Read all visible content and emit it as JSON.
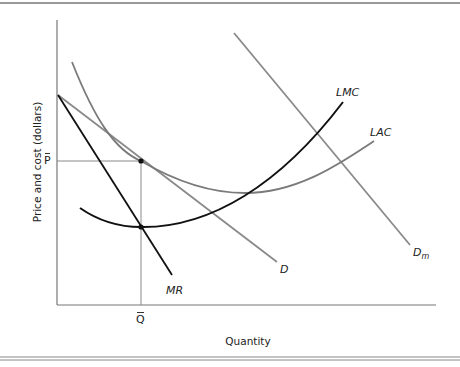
{
  "figure": {
    "type": "economics-diagram",
    "y_axis_label": "Price and cost (dollars)",
    "x_axis_label": "Quantity",
    "y_tick_label": "P",
    "x_tick_label": "Q",
    "curves": {
      "lmc": {
        "label": "LMC",
        "color": "#111111"
      },
      "lac": {
        "label": "LAC",
        "color": "#7a7a7a"
      },
      "d": {
        "label": "D",
        "color": "#8a8a8a"
      },
      "mr": {
        "label": "MR",
        "color": "#111111"
      },
      "dm": {
        "label_main": "D",
        "label_sub": "m",
        "color": "#8a8a8a"
      }
    },
    "points": {
      "tangency": "LAC tangent to D at (Q-bar, P-bar)",
      "mr_lmc": "MR = LMC at Q-bar"
    }
  }
}
